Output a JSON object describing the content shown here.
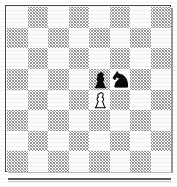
{
  "diagram": {
    "kind": "chessboard-diagram",
    "files": [
      "a",
      "b",
      "c",
      "d",
      "e",
      "f",
      "g",
      "h"
    ],
    "ranks": [
      "8",
      "7",
      "6",
      "5",
      "4",
      "3",
      "2",
      "1"
    ],
    "board_size": 8,
    "orientation": "white-bottom",
    "top_left_square_color": "light",
    "colors": {
      "light_square": "#fcfcfc",
      "dark_square": "#8d8d8d",
      "border": "#4a4a4a",
      "white_piece_fill": "#ffffff",
      "black_piece_fill": "#000000",
      "piece_outline": "#000000",
      "baseline_rule": "#5c5c5c"
    },
    "squares": [
      [
        "light",
        "dark",
        "light",
        "dark",
        "light",
        "dark",
        "light",
        "dark"
      ],
      [
        "dark",
        "light",
        "dark",
        "light",
        "dark",
        "light",
        "dark",
        "light"
      ],
      [
        "light",
        "dark",
        "light",
        "dark",
        "light",
        "dark",
        "light",
        "dark"
      ],
      [
        "dark",
        "light",
        "dark",
        "light",
        "light",
        "dark",
        "dark",
        "light"
      ],
      [
        "light",
        "dark",
        "light",
        "dark",
        "light",
        "dark",
        "light",
        "dark"
      ],
      [
        "dark",
        "light",
        "dark",
        "light",
        "dark",
        "light",
        "dark",
        "light"
      ],
      [
        "light",
        "dark",
        "light",
        "dark",
        "light",
        "dark",
        "light",
        "dark"
      ],
      [
        "dark",
        "light",
        "dark",
        "light",
        "dark",
        "light",
        "dark",
        "light"
      ]
    ],
    "pieces": [
      {
        "square": "e5",
        "row": 3,
        "col": 4,
        "color": "black",
        "type": "pawn",
        "glyph": "♟",
        "label": "black-pawn-e5"
      },
      {
        "square": "f5",
        "row": 3,
        "col": 5,
        "color": "black",
        "type": "knight",
        "glyph": "♞",
        "label": "black-knight-f5"
      },
      {
        "square": "e4",
        "row": 4,
        "col": 4,
        "color": "white",
        "type": "pawn",
        "glyph": "♙",
        "label": "white-pawn-e4"
      }
    ],
    "position_fen": "8/8/8/4pn2/4P3/8/8/8",
    "piece_count": 3
  }
}
